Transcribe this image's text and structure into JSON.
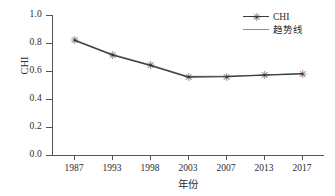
{
  "chart_data": {
    "type": "line",
    "title": "",
    "xlabel": "年份",
    "ylabel": "CHI",
    "categories": [
      "1987",
      "1993",
      "1998",
      "2003",
      "2007",
      "2013",
      "2017"
    ],
    "xtick_labels": [
      "1987",
      "1993",
      "1998",
      "2003",
      "2007",
      "2013",
      "2017"
    ],
    "ytick_labels": [
      "1.0",
      "0.8",
      "0.6",
      "0.4",
      "0.2",
      "0.0"
    ],
    "ytick_values": [
      1.0,
      0.8,
      0.6,
      0.4,
      0.2,
      0.0
    ],
    "ylim": [
      0.0,
      1.0
    ],
    "grid": false,
    "legend_position": "top-right",
    "series": [
      {
        "name": "CHI",
        "marker": "asterisk",
        "color": "#333333",
        "values": [
          0.82,
          0.715,
          0.64,
          0.557,
          0.56,
          0.57,
          0.58
        ]
      },
      {
        "name": "趋势线",
        "marker": "none",
        "color": "#8c8c8c",
        "values": [
          0.825,
          0.72,
          0.645,
          0.562,
          0.563,
          0.572,
          0.583
        ]
      }
    ]
  },
  "legend": {
    "items": [
      {
        "label": "CHI",
        "marker_icon": "asterisk-marker-icon"
      },
      {
        "label": "趋势线",
        "marker_icon": "line-swatch-icon"
      }
    ]
  },
  "axes": {
    "y_title": "CHI",
    "x_title": "年份"
  },
  "marker_glyph": "✳"
}
